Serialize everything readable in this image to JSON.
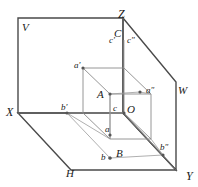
{
  "figure": {
    "type": "descriptive-geometry-projection",
    "width": 198,
    "height": 187,
    "background_color": "#ffffff",
    "line_color": "#808080",
    "frame_color": "#333333",
    "label_color": "#1a1a1a",
    "dot_color": "#555555"
  },
  "planes": [
    {
      "name": "vertical-plane",
      "label": "V",
      "x": 22,
      "y": 22
    },
    {
      "name": "horizontal-plane",
      "label": "H",
      "x": 66,
      "y": 168
    },
    {
      "name": "profile-plane",
      "label": "W",
      "x": 178,
      "y": 85
    }
  ],
  "axes": [
    {
      "name": "axis-z",
      "label": "Z",
      "x": 118,
      "y": 8
    },
    {
      "name": "axis-x",
      "label": "X",
      "x": 6,
      "y": 106
    },
    {
      "name": "axis-y",
      "label": "Y",
      "x": 186,
      "y": 170
    }
  ],
  "points": [
    {
      "name": "origin",
      "label": "O",
      "class": "lbl-vertex",
      "lx": 127,
      "ly": 104,
      "px": 124,
      "py": 113,
      "dot": true
    },
    {
      "name": "point-A",
      "label": "A",
      "class": "lbl-vertex",
      "lx": 97,
      "ly": 89,
      "px": 110,
      "py": 94,
      "dot": true
    },
    {
      "name": "point-B",
      "label": "B",
      "class": "lbl-vertex",
      "lx": 116,
      "ly": 148,
      "px": 110,
      "py": 158,
      "dot": true
    },
    {
      "name": "point-C",
      "label": "C",
      "class": "lbl-vertex",
      "lx": 114,
      "ly": 28,
      "px": 124,
      "py": 40,
      "dot": false
    },
    {
      "name": "point-a-prime",
      "label": "a'",
      "class": "lbl-proj",
      "lx": 74,
      "ly": 61,
      "px": 83,
      "py": 68,
      "dot": true
    },
    {
      "name": "point-a-lower",
      "label": "a",
      "class": "lbl-proj",
      "lx": 105,
      "ly": 125,
      "px": 110,
      "py": 135,
      "dot": true
    },
    {
      "name": "point-a-double",
      "label": "a″",
      "class": "lbl-proj",
      "lx": 146,
      "ly": 86,
      "px": 140,
      "py": 92,
      "dot": true
    },
    {
      "name": "point-b-prime",
      "label": "b'",
      "class": "lbl-proj",
      "lx": 61,
      "ly": 103,
      "px": 67,
      "py": 113,
      "dot": true
    },
    {
      "name": "point-b-lower",
      "label": "b",
      "class": "lbl-proj",
      "lx": 101,
      "ly": 153,
      "px": 110,
      "py": 158,
      "dot": true
    },
    {
      "name": "point-b-double",
      "label": "b″",
      "class": "lbl-proj",
      "lx": 160,
      "ly": 143,
      "px": 163,
      "py": 155,
      "dot": true
    },
    {
      "name": "point-c-prime",
      "label": "c'",
      "class": "lbl-proj",
      "lx": 109,
      "ly": 36,
      "px": 124,
      "py": 42,
      "dot": false
    },
    {
      "name": "point-c-double",
      "label": "c″",
      "class": "lbl-proj",
      "lx": 127,
      "ly": 36,
      "px": 124,
      "py": 42,
      "dot": false
    },
    {
      "name": "point-c-lower",
      "label": "c",
      "class": "lbl-proj",
      "lx": 113,
      "ly": 104,
      "px": 117,
      "py": 113,
      "dot": false
    }
  ]
}
